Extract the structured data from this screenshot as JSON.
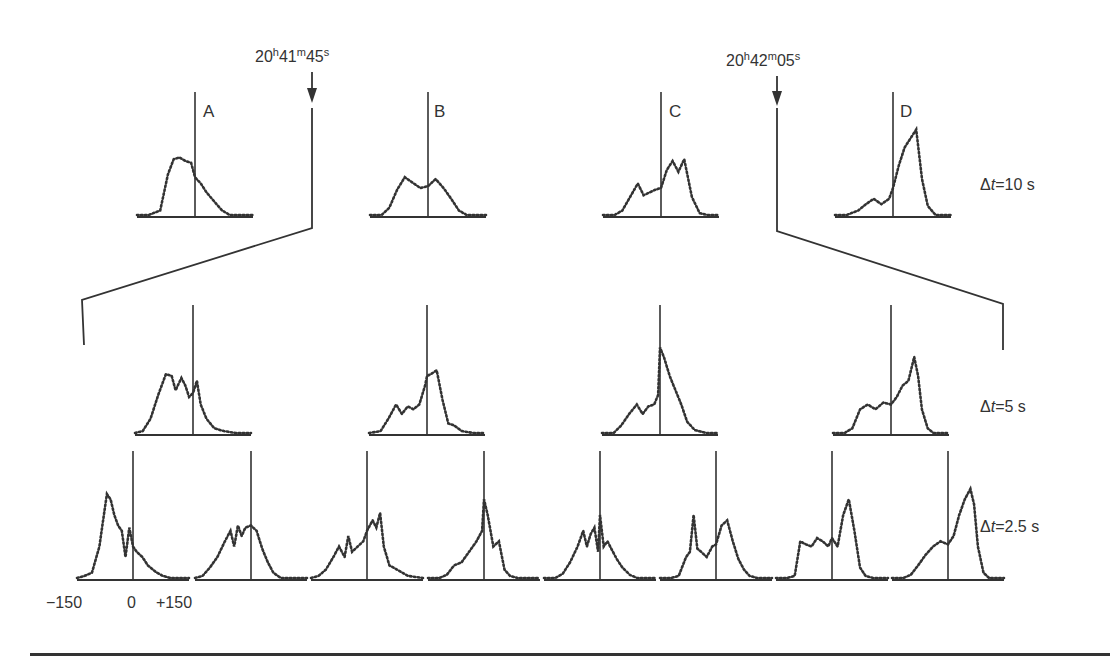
{
  "figure": {
    "markers": [
      {
        "label_h": "20",
        "label_m": "41",
        "label_s": "45",
        "x": 312
      },
      {
        "label_h": "20",
        "label_m": "42",
        "label_s": "05",
        "x": 777
      }
    ],
    "row_labels": [
      {
        "prefix": "Δ",
        "var": "t",
        "text": "=10 s"
      },
      {
        "prefix": "Δ",
        "var": "t",
        "text": "=5 s"
      },
      {
        "prefix": "Δ",
        "var": "t",
        "text": "=2.5 s"
      }
    ],
    "panel_letters": [
      "A",
      "B",
      "C",
      "D"
    ],
    "axis_ticks": [
      "−150",
      "0",
      "+150"
    ],
    "line_color": "#333333",
    "background": "#ffffff"
  },
  "chart_data": [
    {
      "type": "line",
      "title": "Δt = 10 s",
      "xlabel": "offset",
      "xrange": [
        -150,
        150
      ],
      "panels": [
        {
          "name": "A",
          "x": [
            -150,
            -120,
            -90,
            -70,
            -55,
            -40,
            -25,
            -10,
            0,
            15,
            30,
            50,
            70,
            90,
            110,
            150
          ],
          "y": [
            0,
            0,
            0.05,
            0.45,
            0.62,
            0.64,
            0.6,
            0.58,
            0.42,
            0.35,
            0.25,
            0.15,
            0.05,
            0,
            0,
            0
          ]
        },
        {
          "name": "B",
          "x": [
            -150,
            -120,
            -100,
            -80,
            -60,
            -40,
            -20,
            0,
            20,
            40,
            60,
            80,
            100,
            130,
            150
          ],
          "y": [
            0,
            0,
            0.08,
            0.28,
            0.42,
            0.36,
            0.3,
            0.32,
            0.4,
            0.3,
            0.18,
            0.05,
            0,
            0,
            0
          ]
        },
        {
          "name": "C",
          "x": [
            -150,
            -120,
            -100,
            -80,
            -60,
            -45,
            -30,
            -15,
            0,
            15,
            30,
            45,
            60,
            80,
            100,
            120,
            150
          ],
          "y": [
            0,
            0,
            0.05,
            0.2,
            0.35,
            0.22,
            0.25,
            0.28,
            0.3,
            0.5,
            0.6,
            0.48,
            0.62,
            0.2,
            0.02,
            0,
            0
          ]
        },
        {
          "name": "D",
          "x": [
            -150,
            -120,
            -90,
            -70,
            -50,
            -30,
            -10,
            0,
            15,
            30,
            45,
            60,
            75,
            90,
            110,
            150
          ],
          "y": [
            0,
            0,
            0.05,
            0.12,
            0.18,
            0.12,
            0.18,
            0.3,
            0.55,
            0.75,
            0.85,
            0.95,
            0.4,
            0.1,
            0,
            0
          ]
        }
      ]
    },
    {
      "type": "line",
      "title": "Δt = 5 s",
      "xlabel": "offset",
      "xrange": [
        -150,
        150
      ],
      "panels": [
        {
          "x": [
            -150,
            -130,
            -110,
            -90,
            -70,
            -55,
            -45,
            -30,
            -20,
            -10,
            0,
            10,
            20,
            35,
            55,
            80,
            110,
            150
          ],
          "y": [
            0,
            0.02,
            0.15,
            0.4,
            0.62,
            0.6,
            0.45,
            0.58,
            0.5,
            0.38,
            0.42,
            0.55,
            0.3,
            0.15,
            0.05,
            0.02,
            0,
            0
          ]
        },
        {
          "x": [
            -150,
            -120,
            -100,
            -80,
            -65,
            -50,
            -35,
            -20,
            -5,
            0,
            10,
            25,
            40,
            55,
            70,
            90,
            120,
            150
          ],
          "y": [
            0,
            0.02,
            0.15,
            0.3,
            0.2,
            0.28,
            0.25,
            0.3,
            0.5,
            0.6,
            0.62,
            0.66,
            0.35,
            0.1,
            0.08,
            0.02,
            0,
            0
          ]
        },
        {
          "x": [
            -150,
            -120,
            -100,
            -80,
            -60,
            -45,
            -30,
            -15,
            -5,
            0,
            10,
            25,
            40,
            55,
            70,
            90,
            120,
            150
          ],
          "y": [
            0,
            0,
            0.08,
            0.2,
            0.3,
            0.2,
            0.28,
            0.3,
            0.4,
            0.9,
            0.8,
            0.6,
            0.45,
            0.3,
            0.12,
            0.03,
            0,
            0
          ]
        },
        {
          "x": [
            -150,
            -120,
            -100,
            -80,
            -60,
            -40,
            -20,
            0,
            15,
            30,
            45,
            60,
            70,
            80,
            95,
            110,
            150
          ],
          "y": [
            0,
            0,
            0.05,
            0.25,
            0.3,
            0.25,
            0.32,
            0.3,
            0.38,
            0.5,
            0.55,
            0.8,
            0.6,
            0.25,
            0.05,
            0,
            0
          ]
        }
      ]
    },
    {
      "type": "line",
      "title": "Δt = 2.5 s",
      "xlabel": "offset",
      "xrange": [
        -150,
        150
      ],
      "axis_ticks": [
        -150,
        0,
        150
      ],
      "panels": [
        {
          "x": [
            -150,
            -130,
            -110,
            -90,
            -80,
            -70,
            -60,
            -50,
            -40,
            -30,
            -20,
            -10,
            0,
            10,
            25,
            40,
            60,
            80,
            100,
            150
          ],
          "y": [
            0,
            0.02,
            0.05,
            0.3,
            0.55,
            0.8,
            0.75,
            0.6,
            0.5,
            0.45,
            0.2,
            0.48,
            0.3,
            0.25,
            0.2,
            0.12,
            0.06,
            0.02,
            0,
            0
          ]
        },
        {
          "x": [
            -150,
            -130,
            -110,
            -90,
            -70,
            -55,
            -45,
            -35,
            -25,
            -15,
            0,
            15,
            30,
            45,
            60,
            80,
            100,
            150
          ],
          "y": [
            0,
            0.02,
            0.1,
            0.2,
            0.35,
            0.45,
            0.3,
            0.5,
            0.4,
            0.48,
            0.5,
            0.45,
            0.28,
            0.15,
            0.05,
            0,
            0,
            0
          ]
        },
        {
          "x": [
            -150,
            -130,
            -110,
            -90,
            -75,
            -60,
            -50,
            -40,
            -25,
            -10,
            0,
            15,
            25,
            35,
            45,
            60,
            80,
            110,
            150
          ],
          "y": [
            0,
            0.02,
            0.08,
            0.2,
            0.3,
            0.2,
            0.4,
            0.25,
            0.3,
            0.35,
            0.45,
            0.55,
            0.48,
            0.62,
            0.3,
            0.12,
            0.08,
            0.02,
            0
          ]
        },
        {
          "x": [
            -150,
            -120,
            -100,
            -80,
            -60,
            -40,
            -20,
            -5,
            0,
            10,
            25,
            40,
            55,
            70,
            90,
            120,
            150
          ],
          "y": [
            0,
            0,
            0.03,
            0.12,
            0.15,
            0.25,
            0.35,
            0.45,
            0.75,
            0.6,
            0.3,
            0.35,
            0.08,
            0.02,
            0,
            0,
            0
          ]
        },
        {
          "x": [
            -150,
            -120,
            -100,
            -80,
            -60,
            -45,
            -35,
            -25,
            -15,
            -5,
            0,
            10,
            20,
            30,
            45,
            60,
            80,
            100,
            150
          ],
          "y": [
            0,
            0,
            0.04,
            0.15,
            0.3,
            0.45,
            0.3,
            0.42,
            0.48,
            0.25,
            0.6,
            0.3,
            0.35,
            0.28,
            0.18,
            0.1,
            0.03,
            0,
            0
          ]
        },
        {
          "x": [
            -150,
            -120,
            -100,
            -80,
            -70,
            -60,
            -50,
            -40,
            -25,
            -10,
            0,
            15,
            30,
            45,
            60,
            75,
            90,
            110,
            150
          ],
          "y": [
            0,
            0,
            0.02,
            0.2,
            0.25,
            0.6,
            0.28,
            0.25,
            0.2,
            0.3,
            0.32,
            0.5,
            0.55,
            0.35,
            0.18,
            0.08,
            0.02,
            0,
            0
          ]
        },
        {
          "x": [
            -150,
            -120,
            -100,
            -85,
            -70,
            -55,
            -40,
            -25,
            -10,
            0,
            15,
            30,
            45,
            60,
            75,
            90,
            110,
            150
          ],
          "y": [
            0,
            0,
            0.02,
            0.35,
            0.32,
            0.3,
            0.38,
            0.35,
            0.3,
            0.38,
            0.3,
            0.6,
            0.75,
            0.45,
            0.1,
            0.02,
            0,
            0
          ]
        },
        {
          "x": [
            -150,
            -120,
            -100,
            -80,
            -60,
            -40,
            -20,
            0,
            15,
            30,
            45,
            60,
            70,
            80,
            95,
            110,
            150
          ],
          "y": [
            0,
            0,
            0.03,
            0.12,
            0.22,
            0.3,
            0.35,
            0.32,
            0.4,
            0.6,
            0.75,
            0.85,
            0.7,
            0.3,
            0.05,
            0,
            0
          ]
        }
      ]
    }
  ]
}
